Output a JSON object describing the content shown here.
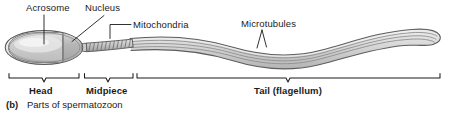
{
  "figure": {
    "caption_tag": "(b)",
    "caption_text": "Parts of spermatozoon",
    "subject": "spermatozoon",
    "style": "grayscale line drawing"
  },
  "callouts": [
    {
      "id": "acrosome",
      "label": "Acrosome",
      "leader": "vertical"
    },
    {
      "id": "nucleus",
      "label": "Nucleus",
      "leader": "diagonal-down-left"
    },
    {
      "id": "mitochondria",
      "label": "Mitochondria",
      "leader": "elbow-left"
    },
    {
      "id": "microtubules",
      "label": "Microtubules",
      "leader": "v-pointer-down"
    }
  ],
  "brackets": [
    {
      "id": "head",
      "label": "Head",
      "x_start": 9,
      "x_end": 79
    },
    {
      "id": "midpiece",
      "label": "Midpiece",
      "x_start": 84,
      "x_end": 133
    },
    {
      "id": "tail",
      "label": "Tail (flagellum)",
      "x_start": 137,
      "x_end": 440
    }
  ],
  "colors": {
    "ink": "#1b1b1b",
    "outline": "#6e6e6e",
    "outline_dark": "#4a4a4a",
    "fill_light": "#f2f2f2",
    "fill_mid": "#d6d6d6",
    "fill_dark": "#bdbdbd",
    "background": "#ffffff"
  },
  "anatomy": {
    "head": "oval cell head containing acrosome cap and nucleus",
    "midpiece": "helically coiled mitochondria sheath",
    "tail": "long wavy flagellum drawn as parallel microtubule lines ending in a rounded tip"
  }
}
